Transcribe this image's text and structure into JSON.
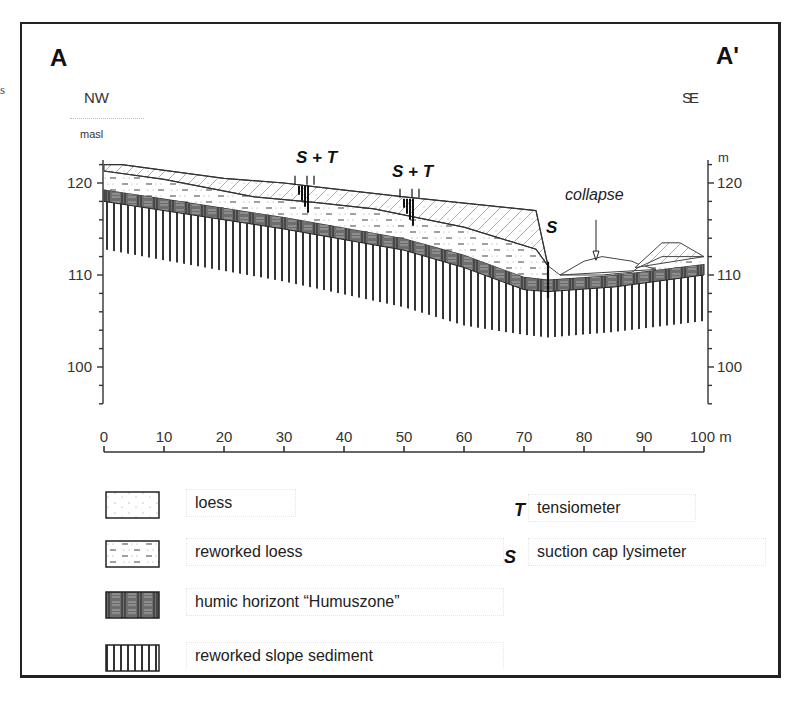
{
  "margin_fragment": "s",
  "section": {
    "left_label": "A",
    "right_label": "A'",
    "left_direction": "NW",
    "right_direction": "SE",
    "left_axis_unit": "masl",
    "right_axis_unit": "m",
    "x_axis_unit": "m"
  },
  "annotations": {
    "station_1": "S + T",
    "station_2": "S + T",
    "station_3": "S",
    "collapse": "collapse"
  },
  "chart_data": {
    "type": "cross-section",
    "xlabel": "m",
    "ylabel": "masl",
    "xlim": [
      0,
      100
    ],
    "ylim": [
      96,
      122
    ],
    "x_ticks": [
      "0",
      "10",
      "20",
      "30",
      "40",
      "50",
      "60",
      "70",
      "80",
      "90",
      "100 m"
    ],
    "y_ticks_left": [
      "120",
      "110",
      "100"
    ],
    "y_ticks_right": [
      "120",
      "110",
      "100"
    ],
    "surfaces": {
      "ground_surface": {
        "x": [
          0,
          3,
          20,
          30,
          35,
          50,
          72,
          74,
          76,
          80,
          83,
          88,
          89,
          93,
          96,
          100
        ],
        "y": [
          122,
          122,
          120.5,
          120,
          119.6,
          118.5,
          117,
          111,
          110,
          111.5,
          112,
          111.5,
          111.2,
          113.5,
          113.5,
          112
        ]
      },
      "loess_base": {
        "x": [
          0,
          10,
          25,
          35,
          45,
          60,
          72,
          74
        ],
        "y": [
          121.3,
          120.4,
          118.5,
          117.9,
          117.2,
          115.2,
          112.8,
          111
        ]
      },
      "humic_top": {
        "x": [
          0,
          10,
          30,
          50,
          60,
          70,
          74,
          85,
          100
        ],
        "y": [
          119.3,
          118.3,
          116.3,
          114,
          112.2,
          109.8,
          109.5,
          110,
          111.2
        ]
      },
      "humic_base": {
        "x": [
          0,
          10,
          30,
          50,
          60,
          70,
          74,
          85,
          100
        ],
        "y": [
          118,
          117,
          115,
          112.7,
          110.8,
          108.4,
          108.2,
          108.7,
          110
        ]
      },
      "sediment_base": {
        "x": [
          0,
          10,
          30,
          50,
          60,
          70,
          74,
          85,
          100
        ],
        "y": [
          112.8,
          111.6,
          109.3,
          106.5,
          104.5,
          103.5,
          103.2,
          103.8,
          105
        ]
      }
    },
    "instruments": [
      {
        "label": "S + T",
        "x": 33,
        "y_surface": 119.8
      },
      {
        "label": "S + T",
        "x": 50.5,
        "y_surface": 118.4
      },
      {
        "label": "S",
        "x": 74,
        "y_surface": 111
      }
    ],
    "collapse_arrow_x": 82,
    "legend": [
      {
        "pattern": "loess",
        "label": "loess"
      },
      {
        "pattern": "reworked-loess",
        "label": "reworked loess"
      },
      {
        "pattern": "humic",
        "label": "humic horizont “Humuszone”"
      },
      {
        "pattern": "slope-sediment",
        "label": "reworked slope sediment"
      }
    ],
    "symbol_legend": [
      {
        "symbol": "T",
        "label": "tensiometer"
      },
      {
        "symbol": "S",
        "label": "suction cap lysimeter"
      }
    ]
  }
}
